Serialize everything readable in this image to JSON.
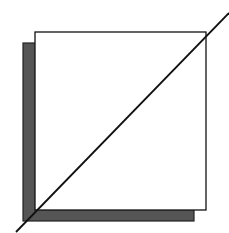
{
  "diagram": {
    "background": "#ffffff",
    "shadow": {
      "x": 23,
      "y": 43,
      "width": 171,
      "height": 178,
      "fill": "#555555",
      "stroke": "#222222"
    },
    "square": {
      "x": 35,
      "y": 32,
      "width": 171,
      "height": 178,
      "fill": "#ffffff",
      "stroke": "#111111"
    },
    "diagonal": {
      "x1": 16,
      "y1": 232,
      "x2": 229,
      "y2": 13,
      "stroke": "#111111"
    }
  }
}
